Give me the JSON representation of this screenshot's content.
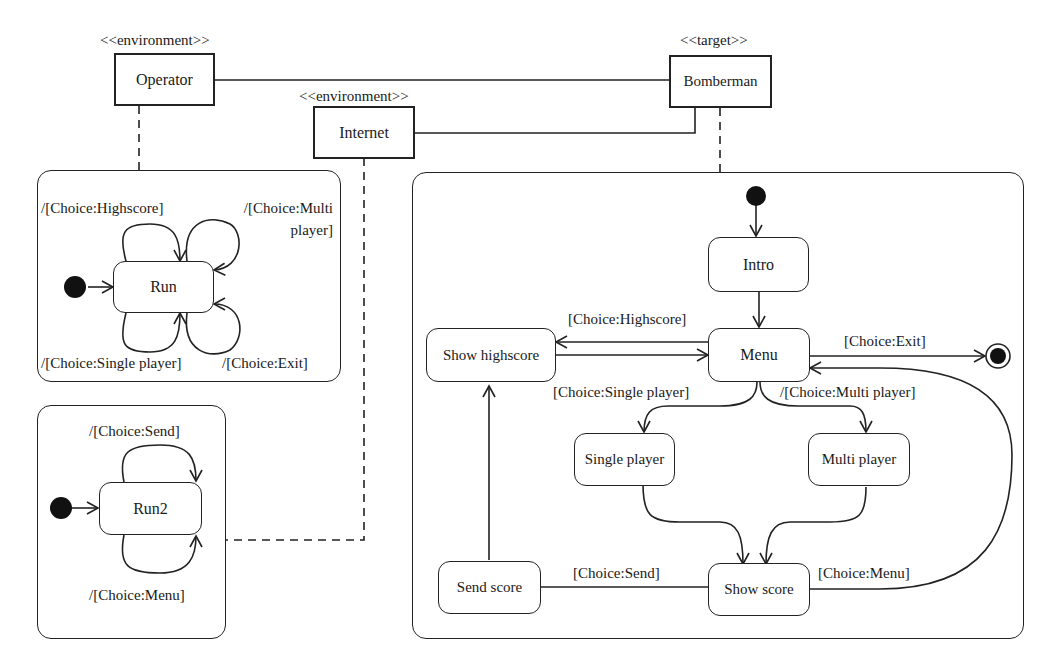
{
  "components": {
    "operator": {
      "stereotype": "<<environment>>",
      "name": "Operator"
    },
    "internet": {
      "stereotype": "<<environment>>",
      "name": "Internet"
    },
    "bomberman": {
      "stereotype": "<<target>>",
      "name": "Bomberman"
    }
  },
  "operator_machine": {
    "state": "Run",
    "transitions": {
      "highscore": "/[Choice:Highscore]",
      "multi_line1": "/[Choice:Multi",
      "multi_line2": "player]",
      "single": "/[Choice:Single player]",
      "exit": "/[Choice:Exit]"
    }
  },
  "internet_machine": {
    "state": "Run2",
    "transitions": {
      "send": "/[Choice:Send]",
      "menu": "/[Choice:Menu]"
    }
  },
  "bomberman_machine": {
    "states": {
      "intro": "Intro",
      "menu": "Menu",
      "show_highscore": "Show highscore",
      "single_player": "Single player",
      "multi_player": "Multi player",
      "show_score": "Show score",
      "send_score": "Send score"
    },
    "transitions": {
      "highscore": "[Choice:Highscore]",
      "exit": "[Choice:Exit]",
      "single": "[Choice:Single player]",
      "multi": "/[Choice:Multi player]",
      "send": "[Choice:Send]",
      "menu": "[Choice:Menu]"
    }
  }
}
